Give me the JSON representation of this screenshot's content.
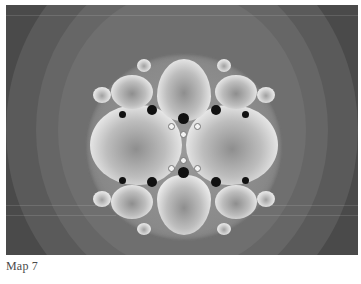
{
  "figure": {
    "caption": "Map 7",
    "image_description": "Grayscale fractal (Kleinian-group style limit set) centered disk with four large lobes, surrounded by concentric gray rings",
    "colors": {
      "background_dark": "#3c3c3c",
      "ring_mid": "#5a5a5a",
      "ring_light": "#6f6f6f",
      "lobe_highlight": "#ffffff",
      "dot_dark": "#111111",
      "caption_text": "#4a4a4a"
    }
  }
}
